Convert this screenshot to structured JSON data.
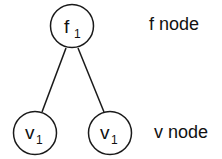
{
  "diagram": {
    "nodes": [
      {
        "id": "f1",
        "type": "f",
        "letter": "f",
        "subscript": "1"
      },
      {
        "id": "v1_left",
        "type": "v",
        "letter": "v",
        "subscript": "1"
      },
      {
        "id": "v1_right",
        "type": "v",
        "letter": "v",
        "subscript": "1"
      }
    ],
    "edges": [
      {
        "from": "f1",
        "to": "v1_left"
      },
      {
        "from": "f1",
        "to": "v1_right"
      }
    ],
    "legend": {
      "f_label": "f node",
      "v_label": "v node"
    }
  }
}
